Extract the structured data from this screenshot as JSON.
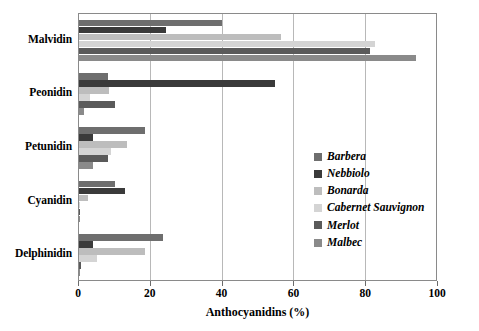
{
  "chart_data": {
    "type": "bar",
    "orientation": "horizontal",
    "title": "",
    "xlabel": "Anthocyanidins (%)",
    "ylabel": "",
    "xlim": [
      0,
      100
    ],
    "xticks": [
      0,
      20,
      40,
      60,
      80,
      100
    ],
    "xtick_labels": [
      "0",
      "20",
      "40",
      "60",
      "80",
      "100"
    ],
    "grid": "vertical",
    "legend_position": "inside-right",
    "categories": [
      "Malvidin",
      "Peonidin",
      "Petunidin",
      "Cyanidin",
      "Delphinidin"
    ],
    "series": [
      {
        "name": "Barbera",
        "color": "#6e6e6e",
        "values": [
          40.0,
          8.0,
          18.5,
          10.0,
          23.5
        ]
      },
      {
        "name": "Nebbiolo",
        "color": "#3a3a3a",
        "values": [
          24.5,
          55.0,
          4.0,
          13.0,
          4.0
        ]
      },
      {
        "name": "Bonarda",
        "color": "#bdbdbd",
        "values": [
          56.5,
          8.5,
          13.5,
          2.5,
          18.5
        ]
      },
      {
        "name": "Cabernet Sauvignon",
        "color": "#d4d4d4",
        "values": [
          83.0,
          3.0,
          9.0,
          0.2,
          5.0
        ]
      },
      {
        "name": "Merlot",
        "color": "#5a5a5a",
        "values": [
          81.5,
          10.0,
          8.0,
          0.2,
          0.5
        ]
      },
      {
        "name": "Malbec",
        "color": "#8a8a8a",
        "values": [
          94.5,
          1.5,
          4.0,
          0.2,
          0.3
        ]
      }
    ]
  },
  "axis": {
    "x_title": "Anthocyanidins (%)"
  },
  "legend": {
    "entries": [
      {
        "label": "Barbera"
      },
      {
        "label": "Nebbiolo"
      },
      {
        "label": "Bonarda"
      },
      {
        "label": "Cabernet Sauvignon"
      },
      {
        "label": "Merlot"
      },
      {
        "label": "Malbec"
      }
    ]
  },
  "colors": {
    "plot_border": "#8a8a8a",
    "gridline": "#b8b8b8",
    "background": "#ffffff",
    "text": "#000000"
  }
}
